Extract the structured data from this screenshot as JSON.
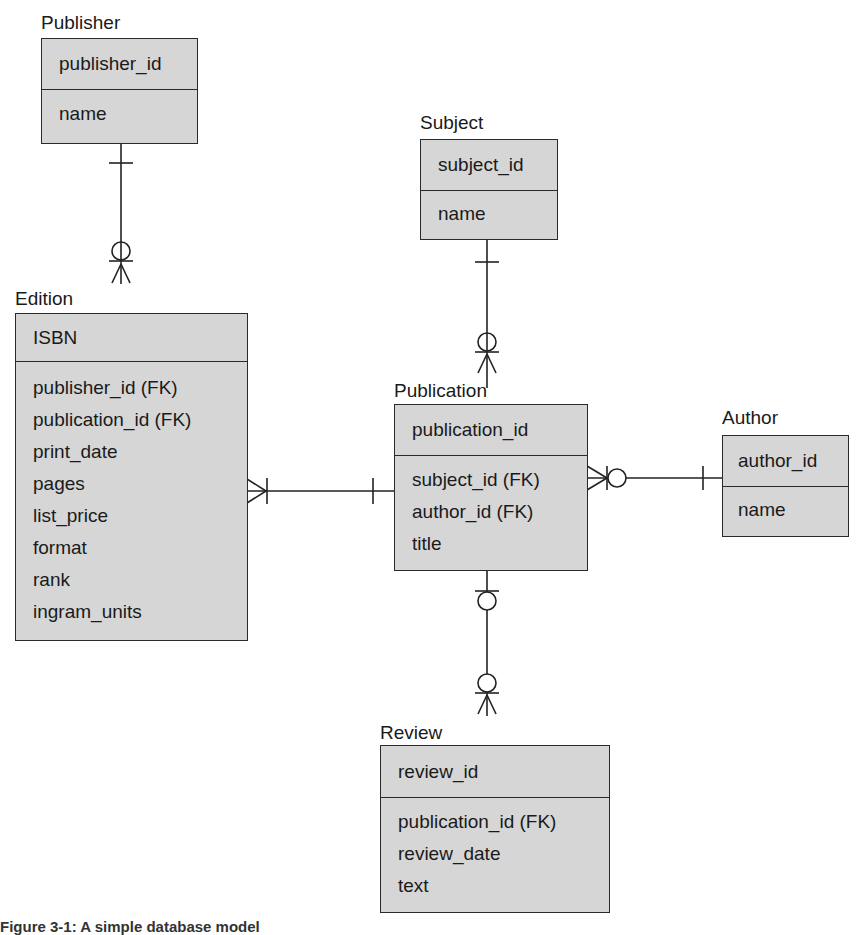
{
  "diagram": {
    "type": "entity-relationship",
    "notation": "crows-foot",
    "entities": [
      {
        "id": "publisher",
        "label": "Publisher",
        "pk": "publisher_id",
        "attributes": [
          "name"
        ]
      },
      {
        "id": "subject",
        "label": "Subject",
        "pk": "subject_id",
        "attributes": [
          "name"
        ]
      },
      {
        "id": "edition",
        "label": "Edition",
        "pk": "ISBN",
        "attributes": [
          "publisher_id (FK)",
          "publication_id (FK)",
          "print_date",
          "pages",
          "list_price",
          "format",
          "rank",
          "ingram_units"
        ]
      },
      {
        "id": "publication",
        "label": "Publication",
        "pk": "publication_id",
        "attributes": [
          "subject_id (FK)",
          "author_id (FK)",
          "title"
        ]
      },
      {
        "id": "author",
        "label": "Author",
        "pk": "author_id",
        "attributes": [
          "name"
        ]
      },
      {
        "id": "review",
        "label": "Review",
        "pk": "review_id",
        "attributes": [
          "publication_id (FK)",
          "review_date",
          "text"
        ]
      }
    ],
    "relationships": [
      {
        "from": "publisher",
        "to": "edition",
        "from_cardinality": "one",
        "to_cardinality": "zero-or-many"
      },
      {
        "from": "subject",
        "to": "publication",
        "from_cardinality": "one",
        "to_cardinality": "zero-or-many"
      },
      {
        "from": "publication",
        "to": "edition",
        "from_cardinality": "one",
        "to_cardinality": "one-or-many"
      },
      {
        "from": "author",
        "to": "publication",
        "from_cardinality": "one",
        "to_cardinality": "zero-or-many"
      },
      {
        "from": "publication",
        "to": "review",
        "from_cardinality": "zero-or-one",
        "to_cardinality": "zero-or-many"
      }
    ]
  },
  "caption": "Figure 3-1: A simple database model"
}
